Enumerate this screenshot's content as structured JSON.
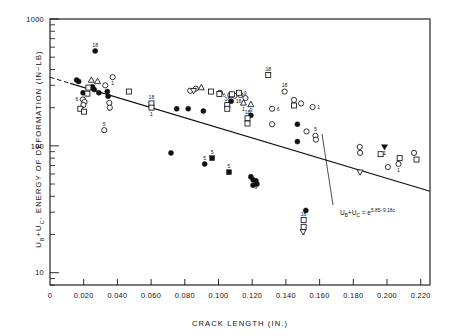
{
  "figure": {
    "width": 460,
    "height": 336,
    "background": "#ffffff",
    "ink_color": "#111111"
  },
  "chart_data": {
    "type": "scatter",
    "title": "",
    "xlabel": "CRACK   LENGTH  (IN.)",
    "ylabel": "ENERGY  OF  DEFORMATION   (IN−LB)",
    "ylabel_prefix": "U",
    "ylabel_prefix_sub_b": "B",
    "ylabel_prefix_plus": "+U",
    "ylabel_prefix_sub_c": "C",
    "ylabel_comma": ",",
    "xscale": "linear",
    "yscale": "log",
    "xlim": [
      0,
      0.2255
    ],
    "ylim": [
      8.0,
      1000
    ],
    "grid": false,
    "legend": "none",
    "xticklabels": [
      "0",
      "0.020",
      "0.040",
      "0.060",
      "0.080",
      "0.100",
      "0.120",
      "0.140",
      "0.160",
      "0.180",
      "0.200",
      "0.220"
    ],
    "xtickvalues": [
      0,
      0.02,
      0.04,
      0.06,
      0.08,
      0.1,
      0.12,
      0.14,
      0.16,
      0.18,
      0.2,
      0.22
    ],
    "yticklabels": [
      "1000",
      "100",
      "10"
    ],
    "ytickvalues": [
      1000,
      100,
      10
    ],
    "fit": {
      "equation_display": "U +U  = e",
      "eq_u1": "U",
      "eq_sub_b": "B",
      "eq_plus": "+U",
      "eq_sub_c": "C",
      "eq_eq": "= e",
      "eq_exponent": "5.85−9.18c",
      "intercept_ln": 5.85,
      "slope_ln": -9.18,
      "x_start": 0.0,
      "x_end": 0.2255,
      "solid_from": 0.012,
      "dashed_from": 0.0,
      "dashed_to": 0.012
    },
    "series": [
      {
        "name": "filled-circle",
        "marker": "filled-circle",
        "points": [
          {
            "x": 0.0268,
            "y": 560,
            "label": "18",
            "label_pos": "above"
          },
          {
            "x": 0.0158,
            "y": 330,
            "label": "",
            "label_pos": ""
          },
          {
            "x": 0.017,
            "y": 322,
            "label": "",
            "label_pos": ""
          },
          {
            "x": 0.0252,
            "y": 292,
            "label": "",
            "label_pos": ""
          },
          {
            "x": 0.0262,
            "y": 278,
            "label": "",
            "label_pos": ""
          },
          {
            "x": 0.029,
            "y": 262,
            "label": "",
            "label_pos": ""
          },
          {
            "x": 0.0196,
            "y": 262,
            "label": "",
            "label_pos": ""
          },
          {
            "x": 0.082,
            "y": 196,
            "label": "",
            "label_pos": ""
          },
          {
            "x": 0.091,
            "y": 188,
            "label": "",
            "label_pos": ""
          },
          {
            "x": 0.0752,
            "y": 196,
            "label": "",
            "label_pos": ""
          },
          {
            "x": 0.1075,
            "y": 225,
            "label": "18",
            "label_pos": "right"
          },
          {
            "x": 0.1468,
            "y": 148,
            "label": "",
            "label_pos": ""
          },
          {
            "x": 0.1468,
            "y": 108,
            "label": "",
            "label_pos": ""
          },
          {
            "x": 0.0718,
            "y": 88,
            "label": "",
            "label_pos": ""
          },
          {
            "x": 0.0918,
            "y": 72,
            "label": "5",
            "label_pos": "above"
          },
          {
            "x": 0.1192,
            "y": 57,
            "label": "",
            "label_pos": ""
          },
          {
            "x": 0.1205,
            "y": 54,
            "label": "",
            "label_pos": ""
          },
          {
            "x": 0.1222,
            "y": 53,
            "label": "9",
            "label_pos": "below"
          },
          {
            "x": 0.1205,
            "y": 49,
            "label": "",
            "label_pos": ""
          },
          {
            "x": 0.1228,
            "y": 50,
            "label": "",
            "label_pos": ""
          },
          {
            "x": 0.1192,
            "y": 174,
            "label": "",
            "label_pos": ""
          },
          {
            "x": 0.1518,
            "y": 31,
            "label": "",
            "label_pos": ""
          },
          {
            "x": 0.034,
            "y": 268,
            "label": "",
            "label_pos": ""
          },
          {
            "x": 0.0345,
            "y": 246,
            "label": "",
            "label_pos": ""
          }
        ]
      },
      {
        "name": "open-circle",
        "marker": "open-circle",
        "points": [
          {
            "x": 0.0372,
            "y": 348,
            "label": "1",
            "label_pos": "below"
          },
          {
            "x": 0.0328,
            "y": 300,
            "label": "",
            "label_pos": ""
          },
          {
            "x": 0.0195,
            "y": 232,
            "label": "6",
            "label_pos": "left"
          },
          {
            "x": 0.0205,
            "y": 222,
            "label": "",
            "label_pos": ""
          },
          {
            "x": 0.0198,
            "y": 210,
            "label": "",
            "label_pos": ""
          },
          {
            "x": 0.0352,
            "y": 218,
            "label": "1",
            "label_pos": "below"
          },
          {
            "x": 0.0355,
            "y": 200,
            "label": "",
            "label_pos": ""
          },
          {
            "x": 0.0322,
            "y": 133,
            "label": "5",
            "label_pos": "above"
          },
          {
            "x": 0.1008,
            "y": 262,
            "label": "",
            "label_pos": ""
          },
          {
            "x": 0.107,
            "y": 252,
            "label": "6",
            "label_pos": "left"
          },
          {
            "x": 0.1095,
            "y": 248,
            "label": "",
            "label_pos": ""
          },
          {
            "x": 0.113,
            "y": 252,
            "label": "",
            "label_pos": ""
          },
          {
            "x": 0.116,
            "y": 238,
            "label": "",
            "label_pos": ""
          },
          {
            "x": 0.1318,
            "y": 196,
            "label": "6",
            "label_pos": "right"
          },
          {
            "x": 0.1392,
            "y": 268,
            "label": "18",
            "label_pos": "above"
          },
          {
            "x": 0.1318,
            "y": 148,
            "label": "",
            "label_pos": ""
          },
          {
            "x": 0.1448,
            "y": 230,
            "label": "1",
            "label_pos": "below"
          },
          {
            "x": 0.149,
            "y": 216,
            "label": "",
            "label_pos": ""
          },
          {
            "x": 0.1558,
            "y": 202,
            "label": "1",
            "label_pos": "right"
          },
          {
            "x": 0.1522,
            "y": 130,
            "label": "",
            "label_pos": ""
          },
          {
            "x": 0.1575,
            "y": 120,
            "label": "5",
            "label_pos": "above"
          },
          {
            "x": 0.1578,
            "y": 112,
            "label": "",
            "label_pos": ""
          },
          {
            "x": 0.1838,
            "y": 98,
            "label": "",
            "label_pos": ""
          },
          {
            "x": 0.184,
            "y": 88,
            "label": "",
            "label_pos": ""
          },
          {
            "x": 0.2068,
            "y": 72,
            "label": "1",
            "label_pos": "below"
          },
          {
            "x": 0.216,
            "y": 88,
            "label": "",
            "label_pos": ""
          },
          {
            "x": 0.2005,
            "y": 68,
            "label": "",
            "label_pos": ""
          },
          {
            "x": 0.0865,
            "y": 282,
            "label": "",
            "label_pos": ""
          },
          {
            "x": 0.0832,
            "y": 272,
            "label": "",
            "label_pos": ""
          }
        ]
      },
      {
        "name": "open-square",
        "marker": "open-square",
        "points": [
          {
            "x": 0.0228,
            "y": 288,
            "label": "",
            "label_pos": ""
          },
          {
            "x": 0.018,
            "y": 196,
            "label": "",
            "label_pos": ""
          },
          {
            "x": 0.0202,
            "y": 186,
            "label": "",
            "label_pos": ""
          },
          {
            "x": 0.0222,
            "y": 258,
            "label": "",
            "label_pos": ""
          },
          {
            "x": 0.0468,
            "y": 268,
            "label": "",
            "label_pos": ""
          },
          {
            "x": 0.0602,
            "y": 216,
            "label": "18",
            "label_pos": "above"
          },
          {
            "x": 0.0602,
            "y": 200,
            "label": "1",
            "label_pos": "below"
          },
          {
            "x": 0.0955,
            "y": 268,
            "label": "",
            "label_pos": ""
          },
          {
            "x": 0.1005,
            "y": 256,
            "label": "",
            "label_pos": ""
          },
          {
            "x": 0.108,
            "y": 255,
            "label": "",
            "label_pos": ""
          },
          {
            "x": 0.1122,
            "y": 262,
            "label": "9",
            "label_pos": "right"
          },
          {
            "x": 0.1052,
            "y": 210,
            "label": "18",
            "label_pos": "above"
          },
          {
            "x": 0.1052,
            "y": 196,
            "label": "",
            "label_pos": ""
          },
          {
            "x": 0.1295,
            "y": 362,
            "label": "18",
            "label_pos": "above"
          },
          {
            "x": 0.1172,
            "y": 165,
            "label": "18",
            "label_pos": "above"
          },
          {
            "x": 0.1172,
            "y": 150,
            "label": "",
            "label_pos": ""
          },
          {
            "x": 0.1448,
            "y": 208,
            "label": "",
            "label_pos": ""
          },
          {
            "x": 0.1505,
            "y": 26,
            "label": "18",
            "label_pos": "above"
          },
          {
            "x": 0.1505,
            "y": 23,
            "label": "1",
            "label_pos": "below"
          },
          {
            "x": 0.1962,
            "y": 86,
            "label": "",
            "label_pos": ""
          },
          {
            "x": 0.2075,
            "y": 80,
            "label": "",
            "label_pos": ""
          },
          {
            "x": 0.2175,
            "y": 78,
            "label": "",
            "label_pos": ""
          }
        ]
      },
      {
        "name": "filled-square",
        "marker": "filled-square",
        "points": [
          {
            "x": 0.1062,
            "y": 62,
            "label": "5",
            "label_pos": "above"
          },
          {
            "x": 0.0962,
            "y": 80,
            "label": "5",
            "label_pos": "above"
          }
        ]
      },
      {
        "name": "open-triangle",
        "marker": "open-triangle",
        "points": [
          {
            "x": 0.0245,
            "y": 330,
            "label": "",
            "label_pos": ""
          },
          {
            "x": 0.0282,
            "y": 322,
            "label": "",
            "label_pos": ""
          },
          {
            "x": 0.0898,
            "y": 288,
            "label": "",
            "label_pos": ""
          },
          {
            "x": 0.1148,
            "y": 218,
            "label": "1",
            "label_pos": "below"
          },
          {
            "x": 0.1192,
            "y": 212,
            "label": "9",
            "label_pos": "below"
          }
        ]
      },
      {
        "name": "open-down-triangle",
        "marker": "open-down-triangle",
        "points": [
          {
            "x": 0.0852,
            "y": 272,
            "label": "",
            "label_pos": ""
          },
          {
            "x": 0.184,
            "y": 62,
            "label": "",
            "label_pos": ""
          },
          {
            "x": 0.1502,
            "y": 21,
            "label": "",
            "label_pos": ""
          }
        ]
      },
      {
        "name": "filled-down-triangle",
        "marker": "filled-down-triangle",
        "points": [
          {
            "x": 0.1985,
            "y": 98,
            "label": "1",
            "label_pos": "below"
          }
        ]
      }
    ]
  }
}
